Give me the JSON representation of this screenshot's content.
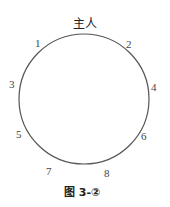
{
  "diagram": {
    "host_label": "主人",
    "seats": [
      "1",
      "2",
      "3",
      "4",
      "5",
      "6",
      "7",
      "8"
    ],
    "caption": "图 3-②",
    "circle_color": "#555555"
  }
}
